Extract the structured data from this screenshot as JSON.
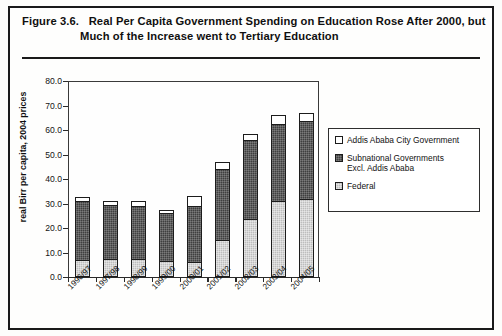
{
  "figure": {
    "number": "Figure 3.6.",
    "title_line_1": "Real Per Capita Government Spending on Education Rose After 2000, but",
    "title_line_2": "Much of the Increase went to Tertiary Education"
  },
  "legend": {
    "items": [
      {
        "label": "Addis Ababa City Government",
        "label_2": "",
        "color": "#ffffff",
        "swatch": "white-swatch"
      },
      {
        "label": "Subnational Governments",
        "label_2": "Excl. Addis Ababa",
        "color": "#3f3f3f",
        "swatch": "dark-swatch"
      },
      {
        "label": "Federal",
        "label_2": "",
        "color": "#bdbdbd",
        "swatch": "light-swatch"
      }
    ]
  },
  "chart_data": {
    "type": "bar",
    "subtype": "stacked-vertical",
    "title": "Real Per Capita Government Spending on Education Rose After 2000, but Much of the Increase went to Tertiary Education",
    "xlabel": "",
    "ylabel": "real Birr per capita, 2004 prices",
    "ylim": [
      0.0,
      80.0
    ],
    "ytick_labels": [
      "0.0",
      "10.0",
      "20.0",
      "30.0",
      "40.0",
      "50.0",
      "60.0",
      "70.0",
      "80.0"
    ],
    "ytick_values": [
      0.0,
      10.0,
      20.0,
      30.0,
      40.0,
      50.0,
      60.0,
      70.0,
      80.0
    ],
    "grid": false,
    "legend_position": "right",
    "categories": [
      "1996/97",
      "1997/98",
      "1998/99",
      "1999/00",
      "2000/01",
      "2001/02",
      "2002/03",
      "2003/04",
      "2004/05"
    ],
    "series": [
      {
        "name": "Federal",
        "color": "#bdbdbd",
        "values": [
          7.0,
          7.5,
          7.5,
          6.5,
          6.0,
          15.0,
          23.5,
          31.0,
          32.0
        ]
      },
      {
        "name": "Subnational Governments Excl. Addis Ababa",
        "color": "#3f3f3f",
        "values": [
          24.0,
          22.0,
          21.5,
          19.5,
          23.0,
          29.0,
          32.5,
          31.5,
          31.5
        ]
      },
      {
        "name": "Addis Ababa City Government",
        "color": "#ffffff",
        "values": [
          1.5,
          1.5,
          2.0,
          1.5,
          4.0,
          3.0,
          2.5,
          3.5,
          3.5
        ]
      }
    ],
    "totals": [
      32.5,
      31.0,
      31.0,
      27.5,
      33.0,
      47.0,
      58.5,
      66.0,
      67.0
    ]
  }
}
